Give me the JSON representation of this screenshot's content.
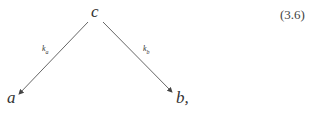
{
  "diagram": {
    "nodes": {
      "top": "c",
      "left": "a",
      "right": "b,"
    },
    "edges": [
      {
        "from": "c",
        "to": "a",
        "label_main": "k",
        "label_sub": "a"
      },
      {
        "from": "c",
        "to": "b",
        "label_main": "k",
        "label_sub": "b"
      }
    ],
    "equation_number": "(3.6)"
  }
}
